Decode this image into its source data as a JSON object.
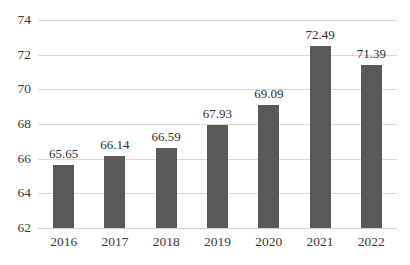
{
  "chart_data": {
    "type": "bar",
    "title": "",
    "subtitle": "",
    "xlabel": "",
    "ylabel": "",
    "categories": [
      "2016",
      "2017",
      "2018",
      "2019",
      "2020",
      "2021",
      "2022"
    ],
    "values": [
      65.65,
      66.14,
      66.59,
      67.93,
      69.09,
      72.49,
      71.39
    ],
    "data_labels": [
      "65.65",
      "66.14",
      "66.59",
      "67.93",
      "69.09",
      "72.49",
      "71.39"
    ],
    "ylim": [
      62,
      74
    ],
    "yticks": [
      62,
      64,
      66,
      68,
      70,
      72,
      74
    ],
    "ytick_labels": [
      "62",
      "64",
      "66",
      "68",
      "70",
      "72",
      "74"
    ],
    "grid": true,
    "grid_axis": "y",
    "legend": false,
    "legend_position": "none",
    "series": [
      {
        "name": "",
        "values": [
          65.65,
          66.14,
          66.59,
          67.93,
          69.09,
          72.49,
          71.39
        ]
      }
    ],
    "colors": {
      "bar": "#595959",
      "gridline": "#d9d9d9",
      "baseline": "#d2d2d2",
      "text": "#3a3a3a",
      "data_label": "#2f2f2f",
      "background": "#ffffff"
    }
  }
}
